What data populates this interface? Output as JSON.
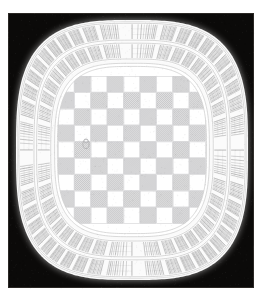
{
  "image": {
    "kind": "pencil-drawing",
    "title": "Round checkerboard plate drawing",
    "width": 262,
    "height": 299,
    "page_background": "#ffffff",
    "panel_background": "#0b0a09"
  },
  "panel": {
    "name": "black-background-panel",
    "x": 8,
    "y": 13,
    "width": 246,
    "height": 275,
    "fill": "#0b0a09",
    "edge_highlight": "#2a2724"
  },
  "plate": {
    "name": "rounded-square-plate",
    "center_x": 132,
    "center_y": 150,
    "radius_x": 116,
    "radius_y": 130,
    "squircle_exponent": 3.1,
    "rim_fill": "#fafafa",
    "rim_shadow": "#dcdcdc"
  },
  "rings": [
    {
      "name": "outer-radial-band",
      "inner_scale": 0.845,
      "outer_scale": 0.975,
      "segments": 44,
      "hatch_color": "#6f6f70",
      "gap_fill": "#fbfbfb",
      "hatch_lines_per_segment": 9,
      "separator_color": "#b9b9b9"
    },
    {
      "name": "inner-radial-band",
      "inner_scale": 0.7,
      "outer_scale": 0.822,
      "segments": 40,
      "hatch_color": "#757576",
      "gap_fill": "#fbfbfb",
      "hatch_lines_per_segment": 8,
      "separator_color": "#b9b9b9"
    }
  ],
  "inner_disc": {
    "name": "checkerboard-disc",
    "scale": 0.655,
    "border_color": "#cfcfcf",
    "border_width": 3,
    "fill": "#ffffff"
  },
  "checkerboard": {
    "name": "checker-grid",
    "columns": 9,
    "rows": 9,
    "cell_size": 16.4,
    "origin_x": 58,
    "origin_y": 76,
    "light_fill": "#ffffff",
    "dark_fill": "#e2e2e3",
    "dark_hatch": "#9a9a9c",
    "grid_line": "#d2d2d4",
    "pattern": [
      [
        0,
        1,
        0,
        1,
        0,
        1,
        0,
        1,
        0
      ],
      [
        1,
        0,
        1,
        0,
        1,
        0,
        1,
        0,
        1
      ],
      [
        0,
        1,
        0,
        1,
        0,
        1,
        0,
        1,
        0
      ],
      [
        1,
        0,
        1,
        0,
        1,
        0,
        1,
        0,
        1
      ],
      [
        0,
        1,
        0,
        1,
        0,
        1,
        0,
        1,
        0
      ],
      [
        1,
        0,
        1,
        0,
        1,
        0,
        1,
        0,
        1
      ],
      [
        0,
        1,
        0,
        1,
        0,
        1,
        0,
        1,
        0
      ],
      [
        1,
        0,
        1,
        0,
        1,
        0,
        1,
        0,
        1
      ],
      [
        0,
        1,
        0,
        1,
        0,
        1,
        0,
        1,
        0
      ]
    ]
  },
  "marks": [
    {
      "name": "game-piece-mark",
      "x": 86,
      "y": 144,
      "radius": 4.5,
      "color": "#9c9c9e",
      "note": "faint figure drawn inside one checker square"
    }
  ],
  "labels": {
    "alt_text": "Pencil drawing of a rounded-square plate with a checkerboard center surrounded by two bands of radial hatched segments, on a black background."
  }
}
